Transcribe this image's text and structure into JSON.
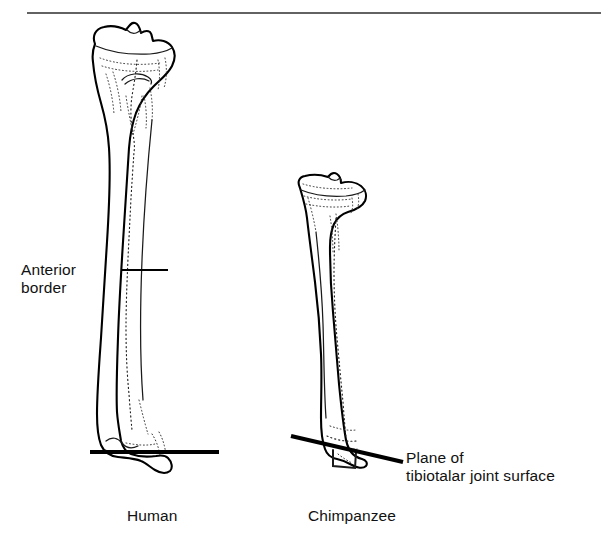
{
  "figure": {
    "background_color": "#ffffff",
    "ink_color": "#000000",
    "top_rule": {
      "name": "top-border-rule",
      "x1": 27,
      "y1": 13,
      "x2": 601,
      "y2": 13
    }
  },
  "labels": {
    "anterior_border_line1": "Anterior",
    "anterior_border_line2": "border",
    "plane_line1": "Plane of",
    "plane_line2": "tibiotalar joint surface",
    "human": "Human",
    "chimpanzee": "Chimpanzee"
  },
  "specimens": [
    {
      "id": "human-tibia",
      "caption": "Human",
      "caption_x": 127,
      "caption_y": 507,
      "plateau_top_y": 24,
      "distal_tip_y": 472,
      "plateau_width_px": 87,
      "shaft_min_width_px": 34,
      "plane_orientation": "horizontal",
      "plane_angle_deg": 0
    },
    {
      "id": "chimpanzee-tibia",
      "caption": "Chimpanzee",
      "caption_x": 308,
      "caption_y": 507,
      "plateau_top_y": 176,
      "distal_tip_y": 466,
      "plateau_width_px": 68,
      "shaft_min_width_px": 22,
      "plane_orientation": "oblique",
      "plane_angle_deg": 13
    }
  ],
  "annotations": {
    "anterior_border": {
      "name": "anterior-border-callout",
      "leader_x1": 122,
      "leader_y1": 270,
      "leader_x2": 168,
      "leader_y2": 270,
      "text_x": 21,
      "text_y": 261
    },
    "plane_human": {
      "name": "human-joint-plane",
      "x1": 90,
      "y1": 452,
      "x2": 219,
      "y2": 452
    },
    "plane_chimp": {
      "name": "chimpanzee-joint-plane",
      "x1": 291,
      "y1": 436,
      "x2": 403,
      "y2": 462
    },
    "plane_callout": {
      "text_x": 406,
      "text_y": 449
    }
  }
}
